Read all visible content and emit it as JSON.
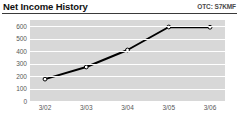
{
  "header": {
    "title": "Net Income History",
    "ticker": "OTC: S7KMF"
  },
  "colors": {
    "plot_background": "#d8d8d8",
    "gridline": "#ffffff",
    "line": "#000000",
    "marker_fill": "#ffffff",
    "title_text": "#111111",
    "axis_text": "#585858",
    "rule": "#3a3a3a"
  },
  "chart_data": {
    "type": "line",
    "title": "Net Income History",
    "xlabel": "",
    "ylabel": "",
    "categories": [
      "3/02",
      "3/03",
      "3/04",
      "3/05",
      "3/06"
    ],
    "values": [
      175,
      272,
      408,
      592,
      590
    ],
    "series": [
      {
        "name": "Net Income",
        "values": [
          175,
          272,
          408,
          592,
          590
        ]
      }
    ],
    "ylim": [
      0,
      650
    ],
    "yticks": [
      0,
      100,
      200,
      300,
      400,
      500,
      600
    ],
    "ytick_labels": [
      "0",
      "100",
      "200",
      "300",
      "400",
      "500",
      "600"
    ],
    "grid": true,
    "grid_orientation": "horizontal",
    "legend": false,
    "markers": true,
    "annotations": [
      "OTC: S7KMF"
    ]
  }
}
